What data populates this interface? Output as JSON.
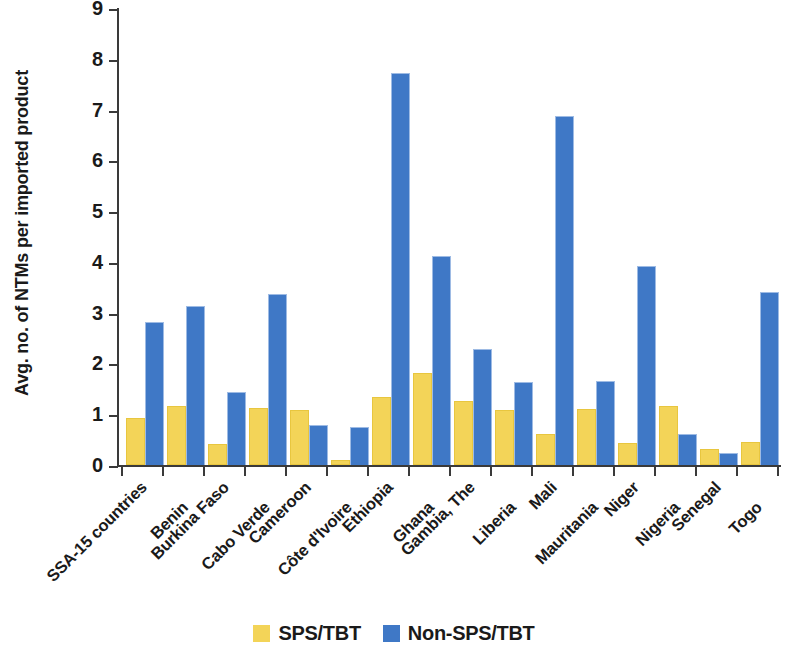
{
  "chart_data": {
    "type": "bar",
    "title": "",
    "xlabel": "",
    "ylabel": "Avg. no. of NTMs per imported product",
    "ylim": [
      0,
      9
    ],
    "ytick_labels": [
      "9",
      "8",
      "7",
      "6",
      "5",
      "4",
      "3",
      "2",
      "1",
      "0"
    ],
    "ytick_values": [
      9,
      8,
      7,
      6,
      5,
      4,
      3,
      2,
      1,
      0
    ],
    "grid": false,
    "legend_position": "bottom",
    "categories": [
      "SSA-15 countries",
      "Benin",
      "Burkina Faso",
      "Cabo Verde",
      "Cameroon",
      "Côte d'Ivoire",
      "Ethiopia",
      "Ghana",
      "Gambia, The",
      "Liberia",
      "Mali",
      "Mauritania",
      "Niger",
      "Nigeria",
      "Senegal",
      "Togo"
    ],
    "series": [
      {
        "name": "SPS/TBT",
        "color": "#f3d458",
        "values": [
          0.88,
          1.13,
          0.38,
          1.09,
          1.05,
          0.05,
          1.3,
          1.78,
          1.22,
          1.05,
          0.57,
          1.06,
          0.4,
          1.12,
          0.27,
          0.41
        ]
      },
      {
        "name": "Non-SPS/TBT",
        "color": "#3f78c6",
        "values": [
          2.8,
          3.12,
          1.42,
          3.35,
          0.77,
          0.72,
          7.71,
          4.1,
          2.27,
          1.62,
          6.85,
          1.64,
          3.9,
          0.6,
          0.22,
          3.39
        ]
      }
    ]
  },
  "legend": {
    "items": [
      {
        "label": "SPS/TBT",
        "swatch": "sps"
      },
      {
        "label": "Non-SPS/TBT",
        "swatch": "nonsps"
      }
    ]
  },
  "colors": {
    "sps": "#f3d458",
    "non_sps": "#3f78c6",
    "axis": "#3a3a3a",
    "text": "#1a1a1a",
    "background": "#ffffff"
  }
}
